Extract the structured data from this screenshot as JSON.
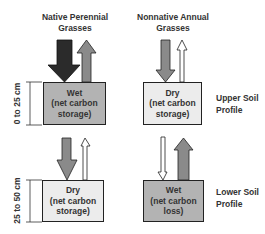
{
  "columns": [
    {
      "title_line1": "Native Perennial",
      "title_line2": "Grasses"
    },
    {
      "title_line1": "Nonnative Annual",
      "title_line2": "Grasses"
    }
  ],
  "rows": [
    {
      "label_line1": "Upper Soil",
      "label_line2": "Profile",
      "depth": "0 to 25 cm"
    },
    {
      "label_line1": "Lower Soil",
      "label_line2": "Profile",
      "depth": "25 to 50 cm"
    }
  ],
  "boxes": {
    "upper_native": {
      "state": "Wet",
      "line2": "(net carbon",
      "line3": "storage)",
      "fill": "#b3b3b3"
    },
    "upper_nonnative": {
      "state": "Dry",
      "line2": "(net carbon",
      "line3": "storage)",
      "fill": "#ececec"
    },
    "lower_native": {
      "state": "Dry",
      "line2": "(net carbon",
      "line3": "storage)",
      "fill": "#ececec"
    },
    "lower_nonnative": {
      "state": "Wet",
      "line2": "(net carbon",
      "line3": "loss)",
      "fill": "#b3b3b3"
    }
  },
  "colors": {
    "dark_arrow": "#2b2b2b",
    "gray_arrow": "#8a8a8a",
    "white_arrow": "#ffffff",
    "outline": "#222222"
  }
}
